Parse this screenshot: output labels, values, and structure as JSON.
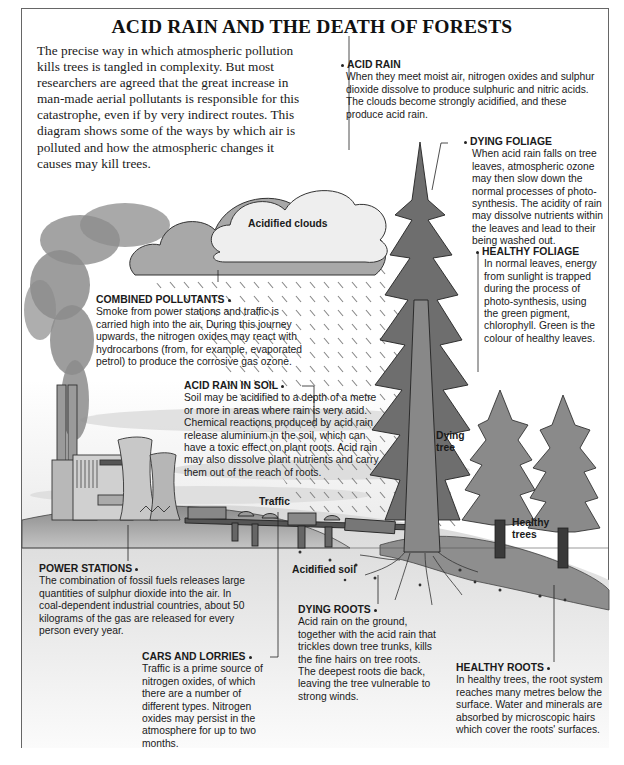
{
  "title": "ACID RAIN AND THE DEATH OF FORESTS",
  "intro": "The precise way in which atmospheric pollution kills trees is tangled in complexity. But most researchers are agreed that the great increase in man-made aerial pollutants is responsible for this catastrophe, even if by very indirect routes. This diagram shows some of the ways by which air is polluted and how the atmospheric changes it causes may kill trees.",
  "captions": {
    "acid_rain": {
      "heading": "ACID RAIN",
      "body": "When they meet moist air, nitrogen oxides and sulphur dioxide dissolve to produce sulphuric and nitric acids. The clouds become strongly acidified, and these produce acid rain."
    },
    "dying_foliage": {
      "heading": "DYING FOLIAGE",
      "body": "When acid rain falls on tree leaves, atmospheric ozone may then slow down the normal processes of photo-synthesis. The acidity of rain may dissolve nutrients within the leaves and lead to their being washed out."
    },
    "healthy_foliage": {
      "heading": "HEALTHY FOLIAGE",
      "body": "In normal leaves, energy from sunlight is trapped during the process of photo-synthesis, using the green pigment, chlorophyll. Green is the colour of healthy leaves."
    },
    "combined_pollutants": {
      "heading": "COMBINED POLLUTANTS",
      "body": "Smoke from power stations and traffic is carried high into the air. During this journey upwards, the nitrogen oxides may react with hydrocarbons (from, for example, evaporated petrol) to produce the corrosive gas ozone."
    },
    "acid_rain_in_soil": {
      "heading": "ACID RAIN IN SOIL",
      "body": "Soil may be acidified to a depth of a metre or more in areas where rain is very acid. Chemical reactions produced by acid rain release aluminium in the soil, which can have a toxic effect on plant roots. Acid rain may also dissolve plant nutrients and carry them out of the reach of roots."
    },
    "power_stations": {
      "heading": "POWER STATIONS",
      "body": "The combination of fossil fuels releases large quantities of sulphur dioxide into the air. In coal-dependent industrial countries, about 50 kilograms of the gas are released for every person every year."
    },
    "cars_and_lorries": {
      "heading": "CARS AND LORRIES",
      "body": "Traffic is a prime source of nitrogen oxides, of which there are a number of different types. Nitrogen oxides may persist in the atmosphere for up to two months."
    },
    "dying_roots": {
      "heading": "DYING ROOTS",
      "body": "Acid rain on the ground, together with the acid rain that trickles down tree trunks, kills the fine hairs on tree roots. The deepest roots die back, leaving the tree vulnerable to strong winds."
    },
    "healthy_roots": {
      "heading": "HEALTHY ROOTS",
      "body": "In healthy trees, the root system reaches many metres below the surface. Water and minerals are absorbed by microscopic hairs which cover the roots' surfaces."
    }
  },
  "labels": {
    "acidified_clouds": "Acidified clouds",
    "traffic": "Traffic",
    "acidified_soil": "Acidified soil",
    "dying_tree_1": "Dying",
    "dying_tree_2": "tree",
    "healthy_trees_1": "Healthy",
    "healthy_trees_2": "trees"
  }
}
